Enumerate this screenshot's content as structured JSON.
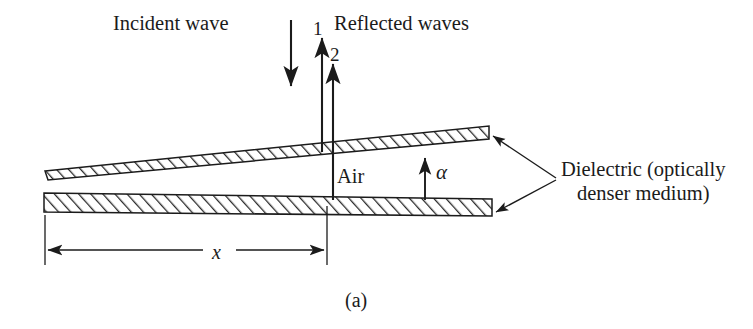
{
  "figure": {
    "caption": "(a)",
    "labels": {
      "incident_wave": "Incident wave",
      "reflected_waves": "Reflected waves",
      "ray_1": "1",
      "ray_2": "2",
      "air": "Air",
      "angle": "α",
      "dielectric_line1": "Dielectric (optically",
      "dielectric_line2": "denser medium)",
      "distance": "x"
    },
    "colors": {
      "background": "#ffffff",
      "ink": "#1b1b1b",
      "hatch": "#2a2a2a"
    }
  }
}
